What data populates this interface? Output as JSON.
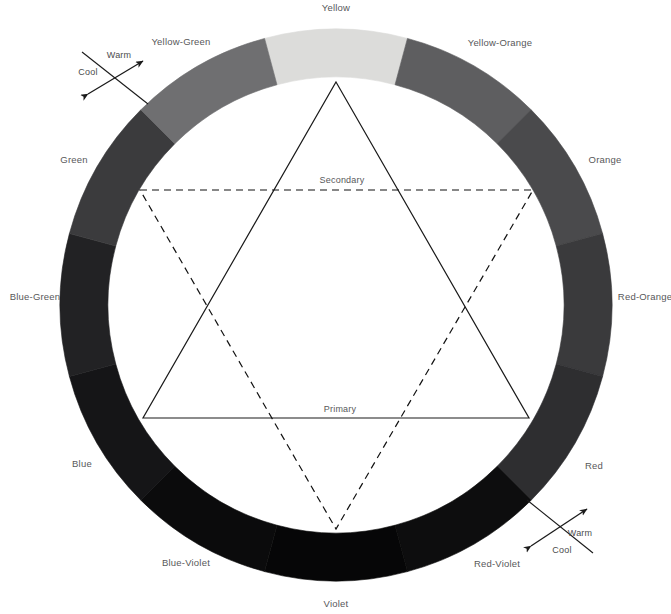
{
  "diagram": {
    "type": "color-wheel",
    "center": {
      "x": 336,
      "y": 305
    },
    "outer_radius": 276,
    "inner_radius": 228,
    "segments": [
      {
        "name": "Yellow",
        "color": "#dcdcda",
        "start_angle": -15,
        "end_angle": 15,
        "label_x": 336,
        "label_y": 8
      },
      {
        "name": "Yellow-Orange",
        "color": "#5e5e60",
        "start_angle": 15,
        "end_angle": 45,
        "label_x": 500,
        "label_y": 43
      },
      {
        "name": "Orange",
        "color": "#4a4a4c",
        "start_angle": 45,
        "end_angle": 75,
        "label_x": 605,
        "label_y": 160
      },
      {
        "name": "Red-Orange",
        "color": "#3a3a3c",
        "start_angle": 75,
        "end_angle": 105,
        "label_x": 645,
        "label_y": 297
      },
      {
        "name": "Red",
        "color": "#2e2e30",
        "start_angle": 105,
        "end_angle": 135,
        "label_x": 594,
        "label_y": 466
      },
      {
        "name": "Red-Violet",
        "color": "#0d0d0e",
        "start_angle": 135,
        "end_angle": 165,
        "label_x": 497,
        "label_y": 564
      },
      {
        "name": "Violet",
        "color": "#060607",
        "start_angle": 165,
        "end_angle": 195,
        "label_x": 336,
        "label_y": 604
      },
      {
        "name": "Blue-Violet",
        "color": "#0b0b0c",
        "start_angle": 195,
        "end_angle": 225,
        "label_x": 186,
        "label_y": 563
      },
      {
        "name": "Blue",
        "color": "#151517",
        "start_angle": 225,
        "end_angle": 255,
        "label_x": 82,
        "label_y": 464
      },
      {
        "name": "Blue-Green",
        "color": "#222224",
        "start_angle": 255,
        "end_angle": 285,
        "label_x": 35,
        "label_y": 297
      },
      {
        "name": "Green",
        "color": "#3b3b3d",
        "start_angle": 285,
        "end_angle": 315,
        "label_x": 74,
        "label_y": 160
      },
      {
        "name": "Yellow-Green",
        "color": "#6f6f71",
        "start_angle": 315,
        "end_angle": 345,
        "label_x": 181,
        "label_y": 42
      }
    ],
    "triangles": [
      {
        "name": "Primary",
        "style": "solid",
        "label": "Primary",
        "label_x": 340,
        "label_y": 409,
        "points": "336,82 529,418 143,418",
        "stroke": "#1a1a1a"
      },
      {
        "name": "Secondary",
        "style": "dashed",
        "label": "Secondary",
        "label_x": 342,
        "label_y": 180,
        "points": "140,190 533,190 336,529",
        "stroke": "#111111"
      }
    ],
    "temperature_markers": [
      {
        "position": "upper-left",
        "warm_label": "Warm",
        "cool_label": "Cool",
        "warm_x": 119,
        "warm_y": 55,
        "cool_x": 88,
        "cool_y": 72,
        "arrow_x1": 88,
        "arrow_y1": 94,
        "arrow_x2": 143,
        "arrow_y2": 61,
        "cross_x1": 82,
        "cross_y1": 52,
        "cross_x2": 148,
        "cross_y2": 104
      },
      {
        "position": "lower-right",
        "warm_label": "Warm",
        "cool_label": "Cool",
        "warm_x": 580,
        "warm_y": 533,
        "cool_x": 562,
        "cool_y": 550,
        "arrow_x1": 531,
        "arrow_y1": 546,
        "arrow_x2": 587,
        "arrow_y2": 509,
        "cross_x1": 527,
        "cross_y1": 500,
        "cross_x2": 593,
        "cross_y2": 553
      }
    ]
  }
}
